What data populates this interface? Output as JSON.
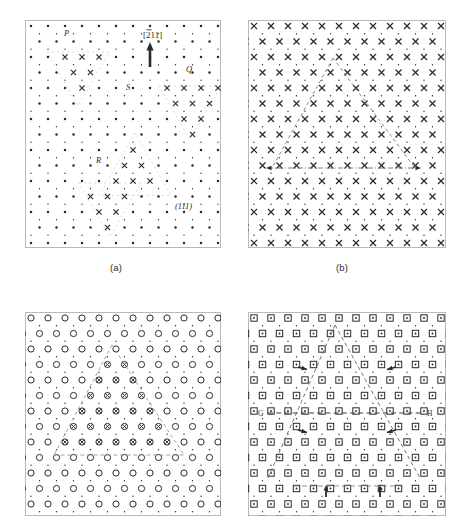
{
  "figure": {
    "kind": "crystallographic-lattice-diagram",
    "panel_count": 4,
    "background": "#ffffff",
    "ink": "#2b2b2b",
    "guide_color": "#9a9a9a"
  },
  "captions": [
    {
      "id": "a",
      "text": "(a)"
    },
    {
      "id": "b",
      "text": "(b)"
    },
    {
      "id": "c",
      "text": ""
    },
    {
      "id": "d",
      "text": ""
    }
  ],
  "panels": {
    "a": {
      "name": "panel-a",
      "marker_primary": "dot",
      "marker_secondary": "cross-x",
      "direction_label": "[211]",
      "direction_label_overbar_digit": "2",
      "plane_label": "(111)",
      "region_labels": [
        {
          "id": "P",
          "text": "P",
          "x": 64,
          "y": 36
        },
        {
          "id": "Q",
          "text": "Q",
          "x": 186,
          "y": 72
        },
        {
          "id": "S",
          "text": "S",
          "x": 126,
          "y": 90
        },
        {
          "id": "R",
          "text": "R",
          "x": 96,
          "y": 163
        }
      ],
      "arrow": {
        "name": "direction-arrow",
        "points_up": true
      }
    },
    "b": {
      "name": "panel-b",
      "marker_primary": "cross-x",
      "marker_secondary": "dot",
      "overlay": "dashed-triangle",
      "baseline": "dash-dot-double-arrow"
    },
    "c": {
      "name": "panel-c",
      "marker_primary": "open-circle",
      "marker_inside_triangle": "circle-with-x",
      "overlay": "dashed-triangle"
    },
    "d": {
      "name": "panel-d",
      "marker_primary": "square-with-dot",
      "overlay": "dashed-triangle",
      "horizontal_line_labels": [
        {
          "id": "G",
          "text": "G"
        },
        {
          "id": "H",
          "text": "H"
        }
      ],
      "inward_arrow_count": 4,
      "bottom_arrow_count": 2,
      "bottom_line": "dashed"
    }
  },
  "chart_data": {
    "type": "scatter",
    "title": "",
    "xlabel": "",
    "ylabel": "",
    "lattice": {
      "row_spacing": 15.5,
      "col_spacing": 17.0,
      "secondary_offset": [
        8.5,
        7.75
      ]
    },
    "triangles": {
      "panel_a": [
        {
          "id": "P",
          "apex_down": true,
          "cx": 78,
          "cy": 52,
          "size": 62
        },
        {
          "id": "Q",
          "apex_down": true,
          "cx": 190,
          "cy": 86,
          "size": 62
        },
        {
          "id": "S",
          "apex_up": true,
          "cx": 135,
          "cy": 133,
          "size": 72
        },
        {
          "id": "R",
          "apex_down": true,
          "cx": 110,
          "cy": 183,
          "size": 62
        }
      ],
      "panel_b": {
        "apex_up": true,
        "apex": [
          333,
          58
        ],
        "left": [
          272,
          168
        ],
        "right": [
          415,
          168
        ]
      },
      "panel_c": {
        "apex_up": true,
        "apex": [
          112,
          345
        ],
        "left": [
          54,
          455
        ],
        "right": [
          184,
          455
        ]
      },
      "panel_d": {
        "apex_up": true,
        "apex": [
          335,
          325
        ],
        "left": [
          268,
          478
        ],
        "right": [
          420,
          478
        ]
      }
    }
  }
}
